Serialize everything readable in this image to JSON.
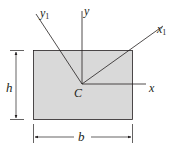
{
  "figure": {
    "shape": "rectangle",
    "fill_color": "#d9d9d9",
    "stroke_color": "#231f20",
    "centroid_label": "C",
    "axes": {
      "x": "x",
      "y": "y",
      "x1": "x",
      "x1_sub": "1",
      "y1": "y",
      "y1_sub": "1"
    },
    "dimensions": {
      "height": "h",
      "width": "b"
    }
  }
}
